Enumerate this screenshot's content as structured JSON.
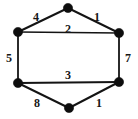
{
  "figure": {
    "type": "weighted-undirected-graph",
    "title": "",
    "background_color": "#ffffff",
    "edge_color": "#141414",
    "node_color": "#0d0d0d",
    "label_color": "#161616",
    "width": 138,
    "height": 119
  },
  "graph": {
    "node_count": 6,
    "edge_count": 6,
    "nodes": [
      {
        "id": "top",
        "name": "node-top",
        "x": 68,
        "y": 8,
        "r": 4.6
      },
      {
        "id": "upper-left",
        "name": "node-upper-left",
        "x": 18,
        "y": 32,
        "r": 4.6
      },
      {
        "id": "upper-right",
        "name": "node-upper-right",
        "x": 119,
        "y": 33,
        "r": 4.6
      },
      {
        "id": "lower-left",
        "name": "node-lower-left",
        "x": 18,
        "y": 83,
        "r": 4.6
      },
      {
        "id": "lower-right",
        "name": "node-lower-right",
        "x": 119,
        "y": 82,
        "r": 4.6
      },
      {
        "id": "bottom",
        "name": "node-bottom",
        "x": 69,
        "y": 108,
        "r": 4.6
      }
    ],
    "edges": [
      {
        "id": "e-upperleft-top",
        "from": "upper-left",
        "to": "top",
        "weight": "4",
        "label_x": 36,
        "label_y": 17,
        "stroke_width": 2.0
      },
      {
        "id": "e-top-upperright",
        "from": "top",
        "to": "upper-right",
        "weight": "1",
        "label_x": 97,
        "label_y": 17,
        "stroke_width": 2.0
      },
      {
        "id": "e-upperleft-upperright",
        "from": "upper-left",
        "to": "upper-right",
        "weight": "2",
        "label_x": 68,
        "label_y": 29,
        "stroke_width": 1.5
      },
      {
        "id": "e-upperleft-lowerleft",
        "from": "upper-left",
        "to": "lower-left",
        "weight": "5",
        "label_x": 9,
        "label_y": 58,
        "stroke_width": 1.8
      },
      {
        "id": "e-upperright-lowerright",
        "from": "upper-right",
        "to": "lower-right",
        "weight": "7",
        "label_x": 128,
        "label_y": 58,
        "stroke_width": 1.8
      },
      {
        "id": "e-lowerleft-lowerright",
        "from": "lower-left",
        "to": "lower-right",
        "weight": "3",
        "label_x": 68,
        "label_y": 75,
        "stroke_width": 2.0
      },
      {
        "id": "e-lowerleft-bottom",
        "from": "lower-left",
        "to": "bottom",
        "weight": "8",
        "label_x": 37,
        "label_y": 103,
        "stroke_width": 2.0
      },
      {
        "id": "e-bottom-lowerright",
        "from": "bottom",
        "to": "lower-right",
        "weight": "1",
        "label_x": 99,
        "label_y": 103,
        "stroke_width": 2.0
      }
    ]
  }
}
